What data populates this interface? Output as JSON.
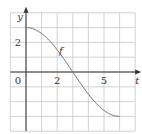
{
  "chart_data": {
    "type": "line",
    "title": "",
    "xlabel": "t",
    "ylabel": "y",
    "xlim": [
      -1,
      7
    ],
    "ylim": [
      -4,
      4
    ],
    "grid": true,
    "x_tick_labels": [
      {
        "value": 2,
        "label": "2"
      },
      {
        "value": 5,
        "label": "5"
      }
    ],
    "y_tick_labels": [
      {
        "value": 2,
        "label": "2"
      }
    ],
    "origin_label": "0",
    "series": [
      {
        "name": "f",
        "x": [
          0,
          0.5,
          1,
          1.5,
          2,
          2.5,
          3,
          3.5,
          4,
          4.5,
          5,
          5.5,
          6
        ],
        "values": [
          3,
          2.9,
          2.6,
          2.12,
          1.5,
          0.78,
          0,
          -0.78,
          -1.5,
          -2.12,
          -2.6,
          -2.9,
          -3
        ]
      }
    ],
    "annotations": [
      {
        "text": "f",
        "x": 2.1,
        "y": 1.3
      }
    ]
  },
  "colors": {
    "grid": "#c8c8c8",
    "axis": "#333333",
    "curve": "#777777"
  }
}
